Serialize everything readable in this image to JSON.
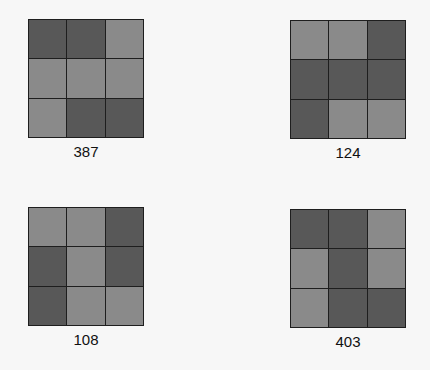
{
  "colors": {
    "dark": "#585858",
    "light": "#8a8a8a",
    "border": "#1e1e1e",
    "background": "#f7f7f7"
  },
  "panels": [
    {
      "label": "387",
      "cells": [
        "dark",
        "dark",
        "light",
        "light",
        "light",
        "light",
        "light",
        "dark",
        "dark"
      ]
    },
    {
      "label": "124",
      "cells": [
        "light",
        "light",
        "dark",
        "dark",
        "dark",
        "dark",
        "dark",
        "light",
        "light"
      ]
    },
    {
      "label": "108",
      "cells": [
        "light",
        "light",
        "dark",
        "dark",
        "light",
        "dark",
        "dark",
        "light",
        "light"
      ]
    },
    {
      "label": "403",
      "cells": [
        "dark",
        "dark",
        "light",
        "light",
        "dark",
        "light",
        "light",
        "dark",
        "dark"
      ]
    }
  ]
}
